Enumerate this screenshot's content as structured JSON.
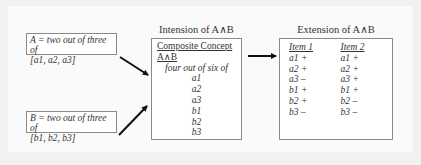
{
  "box_a": {
    "line1": "A = two out of three of",
    "line2": "[a1, a2, a3]"
  },
  "box_b": {
    "line1": "B = two out of three of",
    "line2": "[b1, b2, b3]"
  },
  "intension": {
    "title": "Intension of A∧B",
    "heading": "Composite Concept",
    "concept": "A∧B",
    "rule": "four out of six of",
    "features": [
      "a1",
      "a2",
      "a3",
      "b1",
      "b2",
      "b3"
    ]
  },
  "extension": {
    "title": "Extension of A∧B",
    "items": [
      {
        "label": "Item 1",
        "values": [
          "a1 +",
          "a2 +",
          "a3 –",
          "b1 +",
          "b2 +",
          "b3 –"
        ]
      },
      {
        "label": "Item 2",
        "values": [
          "a1 +",
          "a2 +",
          "a3 +",
          "b1 +",
          "b2 –",
          "b3 –"
        ]
      }
    ]
  },
  "colors": {
    "background": "#f1f1f1",
    "box_border": "#8a8a8a",
    "arrow": "#111111",
    "text": "#333333"
  }
}
